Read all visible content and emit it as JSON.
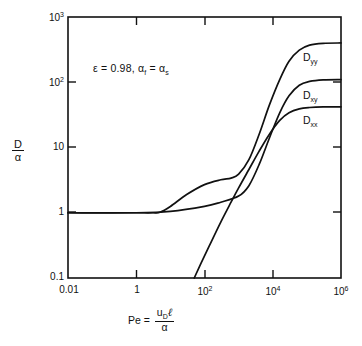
{
  "figure": {
    "background_color": "#ffffff",
    "line_color": "#111111",
    "axis_color": "#111111"
  },
  "annotation": {
    "epsilon_text": "ε = 0.98,",
    "alpha_text": "α",
    "alpha_sub_f": "f",
    "equals": " = ",
    "alpha2_text": "α",
    "alpha_sub_s": "s",
    "full": "ε = 0.98, αf = αs"
  },
  "axis_labels": {
    "y_numerator": "D",
    "y_denominator": "α",
    "x_prefix": "Pe =",
    "x_num_u": "u",
    "x_num_u_sub": "D",
    "x_num_l": "ℓ",
    "x_denominator": "α"
  },
  "y_ticks": [
    {
      "label_base": "10",
      "label_exp": "3",
      "value": 1000
    },
    {
      "label_base": "10",
      "label_exp": "2",
      "value": 100
    },
    {
      "label_base": "10",
      "label_exp": "",
      "value": 10
    },
    {
      "label_base": "1",
      "label_exp": "",
      "value": 1
    },
    {
      "label_base": "0.1",
      "label_exp": "",
      "value": 0.1
    }
  ],
  "x_ticks": [
    {
      "label_base": "0.01",
      "label_exp": "",
      "value": 0.01
    },
    {
      "label_base": "1",
      "label_exp": "",
      "value": 1
    },
    {
      "label_base": "10",
      "label_exp": "2",
      "value": 100
    },
    {
      "label_base": "10",
      "label_exp": "4",
      "value": 10000
    },
    {
      "label_base": "10",
      "label_exp": "6",
      "value": 1000000
    }
  ],
  "curve_labels": [
    {
      "base": "D",
      "sub": "yy"
    },
    {
      "base": "D",
      "sub": "xy"
    },
    {
      "base": "D",
      "sub": "xx"
    }
  ],
  "chart_data": {
    "type": "line",
    "title": "",
    "xlabel": "Pe = u_D ℓ / α",
    "ylabel": "D / α",
    "xscale": "log",
    "yscale": "log",
    "xlim": [
      0.01,
      1000000
    ],
    "ylim": [
      0.1,
      1000
    ],
    "grid": false,
    "legend": "inline-curve-labels",
    "annotations": [
      "ε = 0.98, αf = αs"
    ],
    "series": [
      {
        "name": "D_yy",
        "label": "Dyy",
        "plateau_low": 1.0,
        "shoulder_value": 3.3,
        "plateau_high": 400,
        "points": [
          {
            "x": 0.01,
            "y": 1.0
          },
          {
            "x": 0.1,
            "y": 1.0
          },
          {
            "x": 1,
            "y": 1.0
          },
          {
            "x": 3,
            "y": 1.0
          },
          {
            "x": 5,
            "y": 1.02
          },
          {
            "x": 10,
            "y": 1.25
          },
          {
            "x": 30,
            "y": 1.9
          },
          {
            "x": 100,
            "y": 2.7
          },
          {
            "x": 300,
            "y": 3.2
          },
          {
            "x": 600,
            "y": 3.4
          },
          {
            "x": 1000,
            "y": 3.9
          },
          {
            "x": 2000,
            "y": 6.5
          },
          {
            "x": 4000,
            "y": 16
          },
          {
            "x": 8000,
            "y": 45
          },
          {
            "x": 16000,
            "y": 110
          },
          {
            "x": 30000,
            "y": 210
          },
          {
            "x": 60000,
            "y": 310
          },
          {
            "x": 120000,
            "y": 370
          },
          {
            "x": 300000,
            "y": 395
          },
          {
            "x": 1000000,
            "y": 400
          }
        ]
      },
      {
        "name": "D_xy",
        "label": "Dxy",
        "plateau_low": 1.0,
        "plateau_high": 110,
        "points": [
          {
            "x": 0.01,
            "y": 1.0
          },
          {
            "x": 1,
            "y": 1.0
          },
          {
            "x": 10,
            "y": 1.05
          },
          {
            "x": 100,
            "y": 1.25
          },
          {
            "x": 300,
            "y": 1.45
          },
          {
            "x": 1000,
            "y": 1.8
          },
          {
            "x": 2000,
            "y": 2.6
          },
          {
            "x": 4000,
            "y": 5.5
          },
          {
            "x": 8000,
            "y": 14
          },
          {
            "x": 16000,
            "y": 34
          },
          {
            "x": 30000,
            "y": 62
          },
          {
            "x": 60000,
            "y": 90
          },
          {
            "x": 120000,
            "y": 103
          },
          {
            "x": 300000,
            "y": 109
          },
          {
            "x": 1000000,
            "y": 110
          }
        ]
      },
      {
        "name": "D_xx",
        "label": "Dxx",
        "plateau_high": 42,
        "points": [
          {
            "x": 50,
            "y": 0.1
          },
          {
            "x": 80,
            "y": 0.17
          },
          {
            "x": 150,
            "y": 0.34
          },
          {
            "x": 300,
            "y": 0.72
          },
          {
            "x": 600,
            "y": 1.45
          },
          {
            "x": 1000,
            "y": 2.4
          },
          {
            "x": 2000,
            "y": 4.6
          },
          {
            "x": 4000,
            "y": 8.8
          },
          {
            "x": 8000,
            "y": 16
          },
          {
            "x": 16000,
            "y": 26
          },
          {
            "x": 30000,
            "y": 34
          },
          {
            "x": 60000,
            "y": 39
          },
          {
            "x": 120000,
            "y": 41
          },
          {
            "x": 300000,
            "y": 42
          },
          {
            "x": 1000000,
            "y": 42
          }
        ]
      }
    ]
  },
  "plot_geometry": {
    "left": 68,
    "right": 341,
    "top": 17,
    "bottom": 278
  }
}
